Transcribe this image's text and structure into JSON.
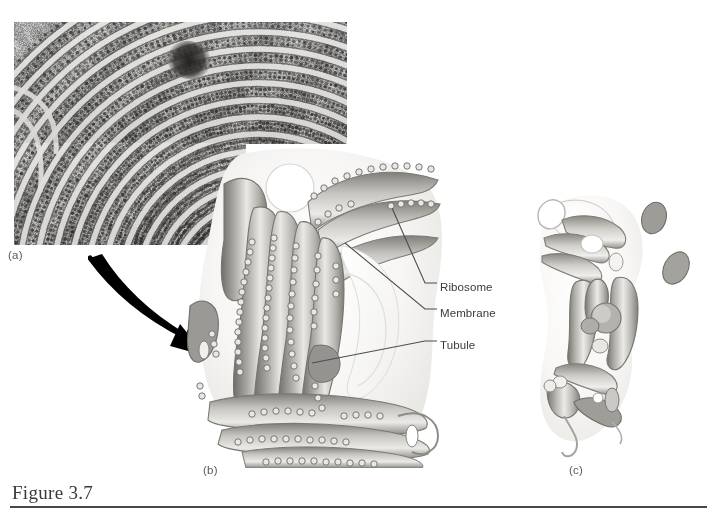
{
  "figure": {
    "caption": "Figure 3.7"
  },
  "panels": [
    {
      "id": "a",
      "label": "(a)",
      "type": "electron-micrograph",
      "description": "Transmission electron micrograph of rough endoplasmic reticulum showing concentric membrane cisternae studded with ribosomes and a dense dark body"
    },
    {
      "id": "b",
      "label": "(b)",
      "type": "illustration",
      "description": "Three-dimensional drawing of rough endoplasmic reticulum: flattened stacked cisternae covered with ribosomes"
    },
    {
      "id": "c",
      "label": "(c)",
      "type": "illustration",
      "description": "Three-dimensional drawing of smooth endoplasmic reticulum: branching tubular network without ribosomes"
    }
  ],
  "callouts": [
    {
      "id": "ribosome",
      "label": "Ribosome"
    },
    {
      "id": "membrane",
      "label": "Membrane"
    },
    {
      "id": "tubule",
      "label": "Tubule"
    }
  ],
  "arrow": {
    "name": "magnification-arrow",
    "description": "Thick curved black arrow pointing from the micrograph down-right to the rough ER illustration"
  },
  "colors": {
    "page_background": "#ffffff",
    "caption_text": "#3c3a38",
    "caption_rule": "#4a4845",
    "panel_label_text": "#5a5a5a",
    "callout_text": "#3a3a3a",
    "leader_line": "#4d4d4d",
    "arrow_fill": "#000000",
    "membrane_light": "#f2f1ef",
    "membrane_mid": "#b9b8b4",
    "membrane_dark": "#8a8985",
    "ribosome_outline": "#6f6e6a",
    "micrograph_base": "#a8a6a2"
  }
}
